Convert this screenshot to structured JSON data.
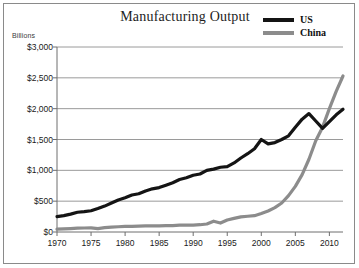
{
  "figure": {
    "title": "Manufacturing Output",
    "units_label": "Billions"
  },
  "legend": {
    "position": "top-right",
    "entries": [
      {
        "label": "US",
        "color": "#141414"
      },
      {
        "label": "China",
        "color": "#8c8c8c"
      }
    ]
  },
  "axes": {
    "y_ticks": [
      "$0",
      "$500",
      "$1,000",
      "$1,500",
      "$2,000",
      "$2,500",
      "$3,000"
    ],
    "x_ticks": [
      "1970",
      "1975",
      "1980",
      "1985",
      "1990",
      "1995",
      "2000",
      "2005",
      "2010"
    ],
    "grid_color": "#9a9a9a",
    "axis_color": "#6e6e6e"
  },
  "chart_data": {
    "type": "line",
    "title": "Manufacturing Output",
    "xlabel": "",
    "ylabel": "Billions",
    "xlim": [
      1970,
      2012
    ],
    "ylim": [
      0,
      3000
    ],
    "y_tick_values": [
      0,
      500,
      1000,
      1500,
      2000,
      2500,
      3000
    ],
    "x_tick_values": [
      1970,
      1975,
      1980,
      1985,
      1990,
      1995,
      2000,
      2005,
      2010
    ],
    "grid": true,
    "legend_position": "top-right",
    "x": [
      1970,
      1971,
      1972,
      1973,
      1974,
      1975,
      1976,
      1977,
      1978,
      1979,
      1980,
      1981,
      1982,
      1983,
      1984,
      1985,
      1986,
      1987,
      1988,
      1989,
      1990,
      1991,
      1992,
      1993,
      1994,
      1995,
      1996,
      1997,
      1998,
      1999,
      2000,
      2001,
      2002,
      2003,
      2004,
      2005,
      2006,
      2007,
      2008,
      2009,
      2010,
      2011,
      2012
    ],
    "series": [
      {
        "name": "US",
        "color": "#141414",
        "values": [
          250,
          265,
          290,
          320,
          330,
          345,
          380,
          420,
          470,
          520,
          555,
          600,
          620,
          665,
          700,
          720,
          760,
          800,
          850,
          880,
          920,
          940,
          1000,
          1020,
          1050,
          1060,
          1120,
          1200,
          1270,
          1350,
          1500,
          1430,
          1450,
          1500,
          1560,
          1700,
          1830,
          1920,
          1800,
          1680,
          1790,
          1900,
          1990
        ]
      },
      {
        "name": "China",
        "color": "#8c8c8c",
        "values": [
          45,
          50,
          55,
          62,
          65,
          68,
          55,
          70,
          78,
          85,
          90,
          92,
          95,
          98,
          100,
          100,
          102,
          105,
          110,
          112,
          112,
          118,
          130,
          175,
          145,
          195,
          220,
          245,
          255,
          265,
          300,
          340,
          395,
          470,
          590,
          740,
          930,
          1180,
          1480,
          1700,
          2000,
          2280,
          2530
        ]
      }
    ]
  }
}
